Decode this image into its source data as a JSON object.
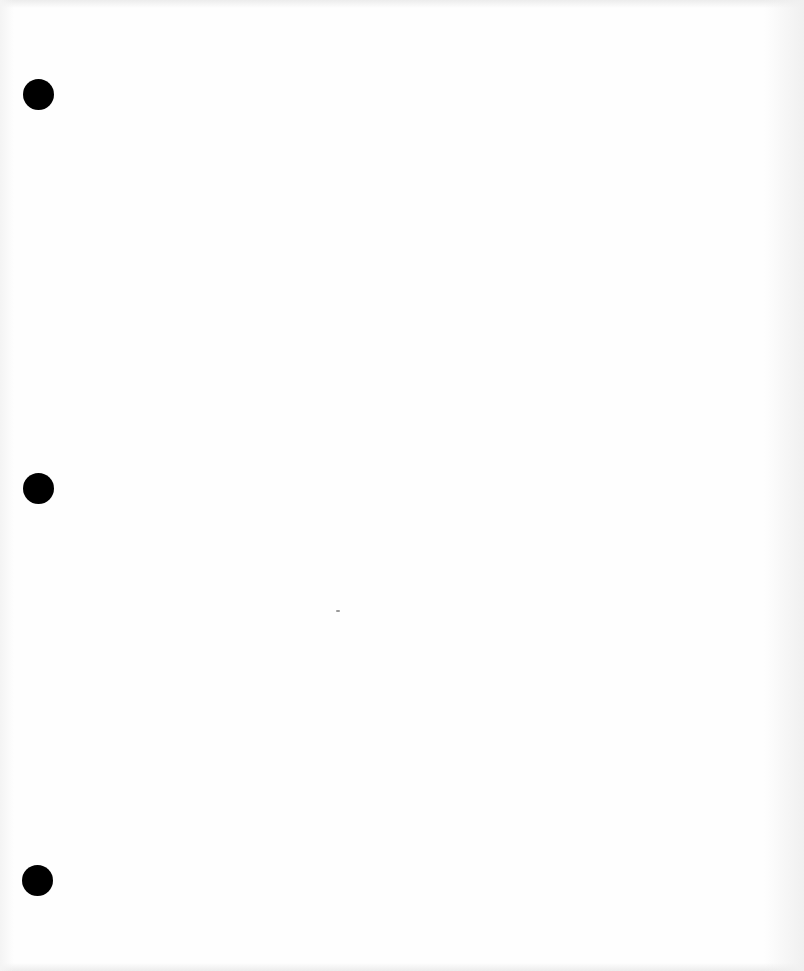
{
  "document": {
    "type": "blank-page",
    "text": "",
    "background_color": "#fefefe",
    "hole_color": "#000000",
    "binder_holes": [
      {
        "name": "top",
        "cx": 38,
        "cy": 94,
        "diameter": 31
      },
      {
        "name": "middle",
        "cx": 38,
        "cy": 488,
        "diameter": 31
      },
      {
        "name": "bottom",
        "cx": 37,
        "cy": 880,
        "diameter": 31
      }
    ],
    "marks": [
      {
        "name": "speck",
        "x": 336,
        "y": 610
      }
    ]
  }
}
